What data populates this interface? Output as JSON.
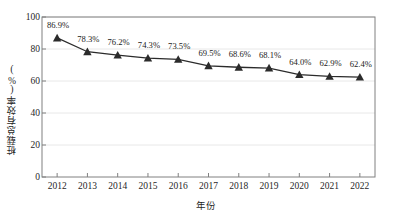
{
  "chart_data": {
    "type": "line",
    "title": "",
    "xlabel": "年份",
    "ylabel": "桩载总有效率(%)",
    "categories": [
      "2012",
      "2013",
      "2014",
      "2015",
      "2016",
      "2017",
      "2018",
      "2019",
      "2020",
      "2021",
      "2022"
    ],
    "values": [
      86.9,
      78.3,
      76.2,
      74.3,
      73.5,
      69.5,
      68.6,
      68.1,
      64.0,
      62.9,
      62.4
    ],
    "point_labels": [
      "86.9%",
      "78.3%",
      "76.2%",
      "74.3%",
      "73.5%",
      "69.5%",
      "68.6%",
      "68.1%",
      "64.0%",
      "62.9%",
      "62.4%"
    ],
    "ylim": [
      0,
      100
    ],
    "y_ticks": [
      "0",
      "20",
      "40",
      "60",
      "80",
      "100"
    ],
    "y_tick_values": [
      0,
      20,
      40,
      60,
      80,
      100
    ],
    "grid": true,
    "legend": "none",
    "marker": "triangle",
    "series_color": "#2b2b2b",
    "grid_color": "#e8e8e8",
    "axis_color": "#808080"
  }
}
